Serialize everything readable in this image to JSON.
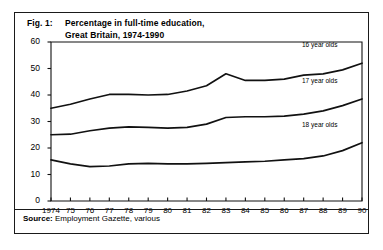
{
  "figure": {
    "fig_label": "Fig. 1:",
    "title_line1": "Percentage in full-time education,",
    "title_line2": "Great Britain, 1974-1990",
    "source_key": "Source:",
    "source_value": " Employment Gazette, various"
  },
  "chart_data": {
    "type": "line",
    "title": "Percentage in full-time education, Great Britain, 1974-1990",
    "xlabel": "",
    "ylabel": "",
    "ylim": [
      0,
      60
    ],
    "yticks": [
      0,
      10,
      20,
      30,
      40,
      50,
      60
    ],
    "grid": false,
    "legend_position": "inline-right",
    "categories": [
      1974,
      1975,
      1976,
      1977,
      1978,
      1979,
      1980,
      1981,
      1982,
      1983,
      1984,
      1985,
      1986,
      1987,
      1988,
      1989,
      1990
    ],
    "tick_labels": [
      "1974",
      "75",
      "76",
      "77",
      "78",
      "79",
      "80",
      "81",
      "82",
      "83",
      "84",
      "85",
      "86",
      "87",
      "88",
      "89",
      "90"
    ],
    "series": [
      {
        "name": "16 year olds",
        "values": [
          35.0,
          36.5,
          38.5,
          40.2,
          40.2,
          40.0,
          40.2,
          41.5,
          43.5,
          48.0,
          45.5,
          45.5,
          46.0,
          47.5,
          48.0,
          49.5,
          52.0
        ]
      },
      {
        "name": "17 year olds",
        "values": [
          25.0,
          25.2,
          26.5,
          27.5,
          28.0,
          27.8,
          27.5,
          27.8,
          29.0,
          31.5,
          31.8,
          31.8,
          32.0,
          32.8,
          34.0,
          36.0,
          38.5
        ]
      },
      {
        "name": "18 year olds",
        "values": [
          15.5,
          14.0,
          13.0,
          13.2,
          14.0,
          14.2,
          14.0,
          14.0,
          14.2,
          14.5,
          14.8,
          15.0,
          15.5,
          16.0,
          17.0,
          19.0,
          22.0
        ]
      }
    ]
  }
}
